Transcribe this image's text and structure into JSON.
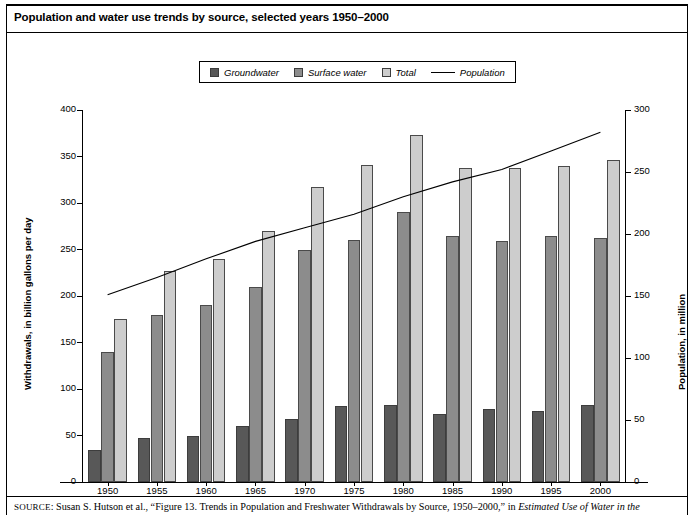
{
  "title": "Population and water use trends by source, selected years 1950–2000",
  "legend": {
    "items": [
      {
        "name": "groundwater",
        "label": "Groundwater",
        "color": "#585858",
        "type": "swatch"
      },
      {
        "name": "surface-water",
        "label": "Surface water",
        "color": "#8c8c8c",
        "type": "swatch"
      },
      {
        "name": "total",
        "label": "Total",
        "color": "#cdcdcd",
        "type": "swatch"
      },
      {
        "name": "population",
        "label": "Population",
        "color": "#000000",
        "type": "line"
      }
    ]
  },
  "source": {
    "prefix": "SOURCE",
    "text": ": Susan S. Hutson et al., “Figure 13. Trends in Population and Freshwater Withdrawals by Source, 1950–2000,” in ",
    "italic_tail": "Estimated Use of Water in the"
  },
  "chart_data": {
    "type": "bar",
    "title": "Population and water use trends by source, selected years 1950–2000",
    "categories": [
      "1950",
      "1955",
      "1960",
      "1965",
      "1970",
      "1975",
      "1980",
      "1985",
      "1990",
      "1995",
      "2000"
    ],
    "xlabel": "",
    "ylabel": "Withdrawals, in billion gallons per day",
    "y2label": "Population, in million",
    "ylim": [
      0,
      400
    ],
    "y2lim": [
      0,
      300
    ],
    "yticks": [
      0,
      50,
      100,
      150,
      200,
      250,
      300,
      350,
      400
    ],
    "y2ticks": [
      0,
      50,
      100,
      150,
      200,
      250,
      300
    ],
    "grid": false,
    "legend_position": "top-center",
    "series": [
      {
        "name": "Groundwater",
        "axis": "left",
        "kind": "bar",
        "color": "#585858",
        "values": [
          34,
          47,
          50,
          60,
          68,
          82,
          83,
          73,
          79,
          76,
          83
        ]
      },
      {
        "name": "Surface water",
        "axis": "left",
        "kind": "bar",
        "color": "#8c8c8c",
        "values": [
          140,
          180,
          190,
          210,
          250,
          260,
          290,
          265,
          259,
          264,
          262
        ]
      },
      {
        "name": "Total",
        "axis": "left",
        "kind": "bar",
        "color": "#cdcdcd",
        "values": [
          175,
          227,
          240,
          270,
          317,
          341,
          373,
          338,
          338,
          340,
          346
        ]
      },
      {
        "name": "Population",
        "axis": "right",
        "kind": "line",
        "color": "#000000",
        "values": [
          151,
          165,
          180,
          194,
          205,
          216,
          230,
          242,
          252,
          267,
          282
        ]
      }
    ]
  }
}
